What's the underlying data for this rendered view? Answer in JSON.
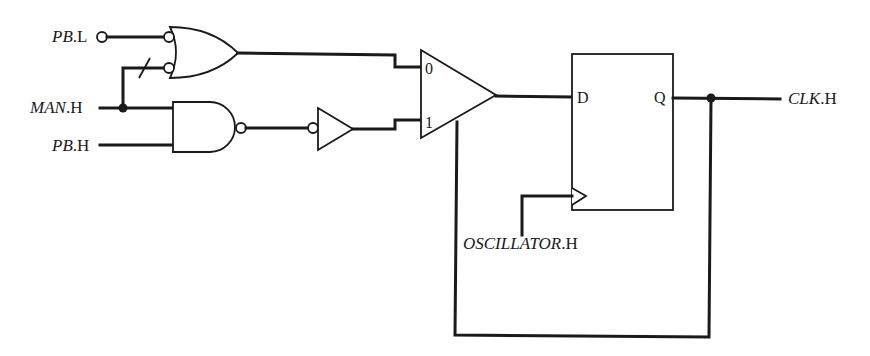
{
  "diagram": {
    "type": "logic-circuit",
    "inputs": [
      {
        "id": "pb_l",
        "name": "PB",
        "suffix": ".L"
      },
      {
        "id": "man_h",
        "name": "MAN",
        "suffix": ".H"
      },
      {
        "id": "pb_h",
        "name": "PB",
        "suffix": ".H"
      },
      {
        "id": "osc_h",
        "name": "OSCILLATOR",
        "suffix": ".H"
      }
    ],
    "outputs": [
      {
        "id": "clk_h",
        "name": "CLK",
        "suffix": ".H"
      }
    ],
    "mux": {
      "input0_label": "0",
      "input1_label": "1"
    },
    "flipflop": {
      "d_label": "D",
      "q_label": "Q"
    },
    "components": [
      "OR gate with inverted inputs",
      "NAND gate",
      "Inverting-input buffer",
      "2:1 multiplexer",
      "D flip-flop"
    ],
    "connections": [
      "PB.L -> OR input A (bubble)",
      "MAN.H -> OR input B (bubble, crossed)",
      "MAN.H -> NAND input A",
      "PB.H -> NAND input B",
      "OR output -> MUX input 0",
      "NAND output -> buffer (bubble input) -> MUX input 1",
      "MUX output -> D",
      "OSCILLATOR.H -> FF clock",
      "Q -> CLK.H",
      "Q -> MUX select (feedback)"
    ]
  }
}
